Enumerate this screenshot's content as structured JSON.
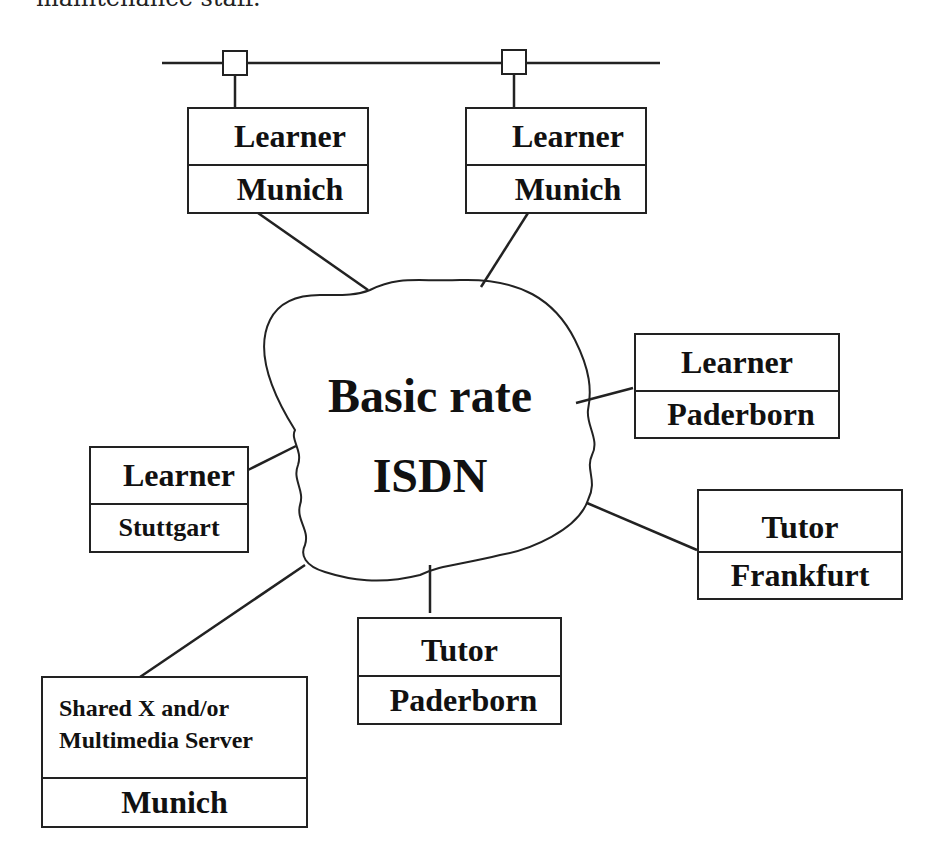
{
  "caption_fragment": "maintenance staff.",
  "network": {
    "line1": "Basic rate",
    "line2": "ISDN"
  },
  "nodes": [
    {
      "id": "learner-munich-1",
      "role": "Learner",
      "location": "Munich"
    },
    {
      "id": "learner-munich-2",
      "role": "Learner",
      "location": "Munich"
    },
    {
      "id": "learner-paderborn",
      "role": "Learner",
      "location": "Paderborn"
    },
    {
      "id": "learner-stuttgart",
      "role": "Learner",
      "location": "Stuttgart"
    },
    {
      "id": "tutor-frankfurt",
      "role": "Tutor",
      "location": "Frankfurt"
    },
    {
      "id": "tutor-paderborn",
      "role": "Tutor",
      "location": "Paderborn"
    },
    {
      "id": "server-munich",
      "role_line1": "Shared X and/or",
      "role_line2": "Multimedia Server",
      "location": "Munich"
    }
  ]
}
